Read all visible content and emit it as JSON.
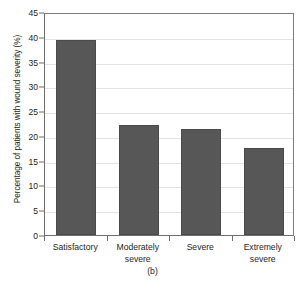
{
  "figure": {
    "caption": "(b)"
  },
  "chart_data": {
    "type": "bar",
    "title": "",
    "subtitle": "",
    "xlabel": "",
    "ylabel": "Percentage of patients with wound severity (%)",
    "categories": [
      "Satisfactory",
      "Moderately severe",
      "Severe",
      "Extremely severe"
    ],
    "category_lines": [
      [
        "Satisfactory"
      ],
      [
        "Moderately",
        "severe"
      ],
      [
        "Severe"
      ],
      [
        "Extremely",
        "severe"
      ]
    ],
    "values": [
      39.3,
      22.3,
      21.4,
      17.5
    ],
    "ylim": [
      0,
      45
    ],
    "ytick_values": [
      0,
      5,
      10,
      15,
      20,
      25,
      30,
      35,
      40,
      45
    ],
    "ytick_labels": [
      "0",
      "5",
      "10",
      "15",
      "20",
      "25",
      "30",
      "35",
      "40",
      "45"
    ],
    "grid": true,
    "grid_axis": "y",
    "legend": false,
    "legend_position": "none",
    "bar_color": "#575757",
    "bar_edge_color": "#4a4a4a",
    "grid_color": "#e3e3e3",
    "axis_color": "#6f6f6f",
    "background_color": "#ffffff",
    "text_color": "#231f20"
  }
}
